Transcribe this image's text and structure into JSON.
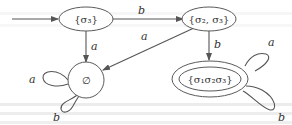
{
  "diagram": {
    "type": "finite-automaton",
    "states": [
      {
        "id": "s3",
        "label": "{σ₃}",
        "initial": true,
        "accepting": false
      },
      {
        "id": "s23",
        "label": "{σ₂, σ₃}",
        "initial": false,
        "accepting": false
      },
      {
        "id": "empty",
        "label": "∅",
        "initial": false,
        "accepting": false
      },
      {
        "id": "s123",
        "label": "{σ₁σ₂σ₃}",
        "initial": false,
        "accepting": true
      }
    ],
    "transitions": [
      {
        "from": "s3",
        "to": "s23",
        "label": "b"
      },
      {
        "from": "s3",
        "to": "empty",
        "label": "a"
      },
      {
        "from": "s23",
        "to": "empty",
        "label": "a"
      },
      {
        "from": "s23",
        "to": "s123",
        "label": "b"
      },
      {
        "from": "empty",
        "to": "empty",
        "label": "a"
      },
      {
        "from": "empty",
        "to": "empty",
        "label": "b"
      },
      {
        "from": "s123",
        "to": "s123",
        "label": "a"
      },
      {
        "from": "s123",
        "to": "s123",
        "label": "b"
      }
    ]
  }
}
